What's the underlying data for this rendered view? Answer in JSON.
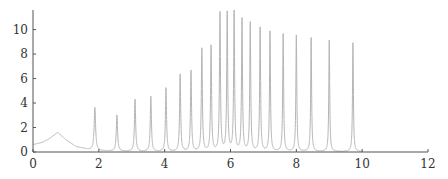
{
  "chart_data": {
    "type": "line",
    "title": "",
    "xlabel": "",
    "ylabel": "",
    "xlim": [
      0,
      12
    ],
    "ylim": [
      0,
      11.6
    ],
    "grid": false,
    "legend": null,
    "x_ticks": [
      "0",
      "2",
      "4",
      "6",
      "8",
      "10",
      "12"
    ],
    "y_ticks": [
      "0",
      "2",
      "4",
      "6",
      "8",
      "10"
    ],
    "series_color": "#b5b5b5",
    "axis_color": "#555555",
    "baseline": {
      "description": "broad hump near x=0.75",
      "x": [
        0.0,
        0.3,
        0.5,
        0.75,
        1.0,
        1.3,
        1.7,
        2.0
      ],
      "y": [
        0.6,
        0.8,
        1.1,
        1.6,
        1.0,
        0.45,
        0.2,
        0.1
      ]
    },
    "peaks": [
      {
        "x": 1.88,
        "y": 3.5
      },
      {
        "x": 2.55,
        "y": 2.95
      },
      {
        "x": 3.1,
        "y": 4.25
      },
      {
        "x": 3.58,
        "y": 4.5
      },
      {
        "x": 4.04,
        "y": 5.2
      },
      {
        "x": 4.47,
        "y": 6.3
      },
      {
        "x": 4.8,
        "y": 6.6
      },
      {
        "x": 5.13,
        "y": 8.4
      },
      {
        "x": 5.41,
        "y": 8.6
      },
      {
        "x": 5.68,
        "y": 11.3
      },
      {
        "x": 5.9,
        "y": 11.3
      },
      {
        "x": 6.11,
        "y": 11.4
      },
      {
        "x": 6.35,
        "y": 10.8
      },
      {
        "x": 6.6,
        "y": 10.5
      },
      {
        "x": 6.9,
        "y": 10.1
      },
      {
        "x": 7.2,
        "y": 9.8
      },
      {
        "x": 7.6,
        "y": 9.6
      },
      {
        "x": 8.0,
        "y": 9.5
      },
      {
        "x": 8.45,
        "y": 9.3
      },
      {
        "x": 9.0,
        "y": 9.1
      },
      {
        "x": 9.72,
        "y": 8.9
      }
    ],
    "curve_end_x": 10.0
  }
}
